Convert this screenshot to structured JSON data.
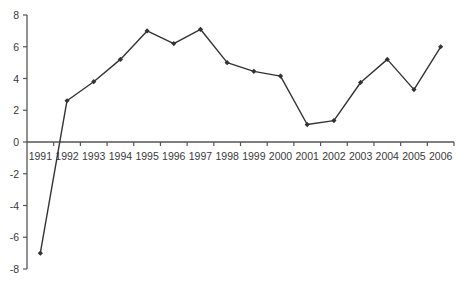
{
  "chart_data": {
    "type": "line",
    "title": "",
    "xlabel": "",
    "ylabel": "",
    "categories": [
      "1991",
      "1992",
      "1993",
      "1994",
      "1995",
      "1996",
      "1997",
      "1998",
      "1999",
      "2000",
      "2001",
      "2002",
      "2003",
      "2004",
      "2005",
      "2006"
    ],
    "series": [
      {
        "name": "Series 1",
        "values": [
          -7.0,
          2.6,
          3.8,
          5.2,
          7.0,
          6.2,
          7.1,
          5.0,
          4.45,
          4.15,
          1.1,
          1.35,
          3.75,
          5.2,
          3.3,
          6.0
        ],
        "color": "#333333",
        "marker": "diamond"
      }
    ],
    "ylim": [
      -8,
      8
    ],
    "yticks": [
      8,
      6,
      4,
      2,
      0,
      -2,
      -4,
      -6,
      -8
    ],
    "grid": false,
    "legend": "none",
    "x_axis_position": "y=0"
  },
  "colors": {
    "background": "#ffffff",
    "line": "#333333",
    "axis": "#555555",
    "text": "#3a3a3a"
  }
}
